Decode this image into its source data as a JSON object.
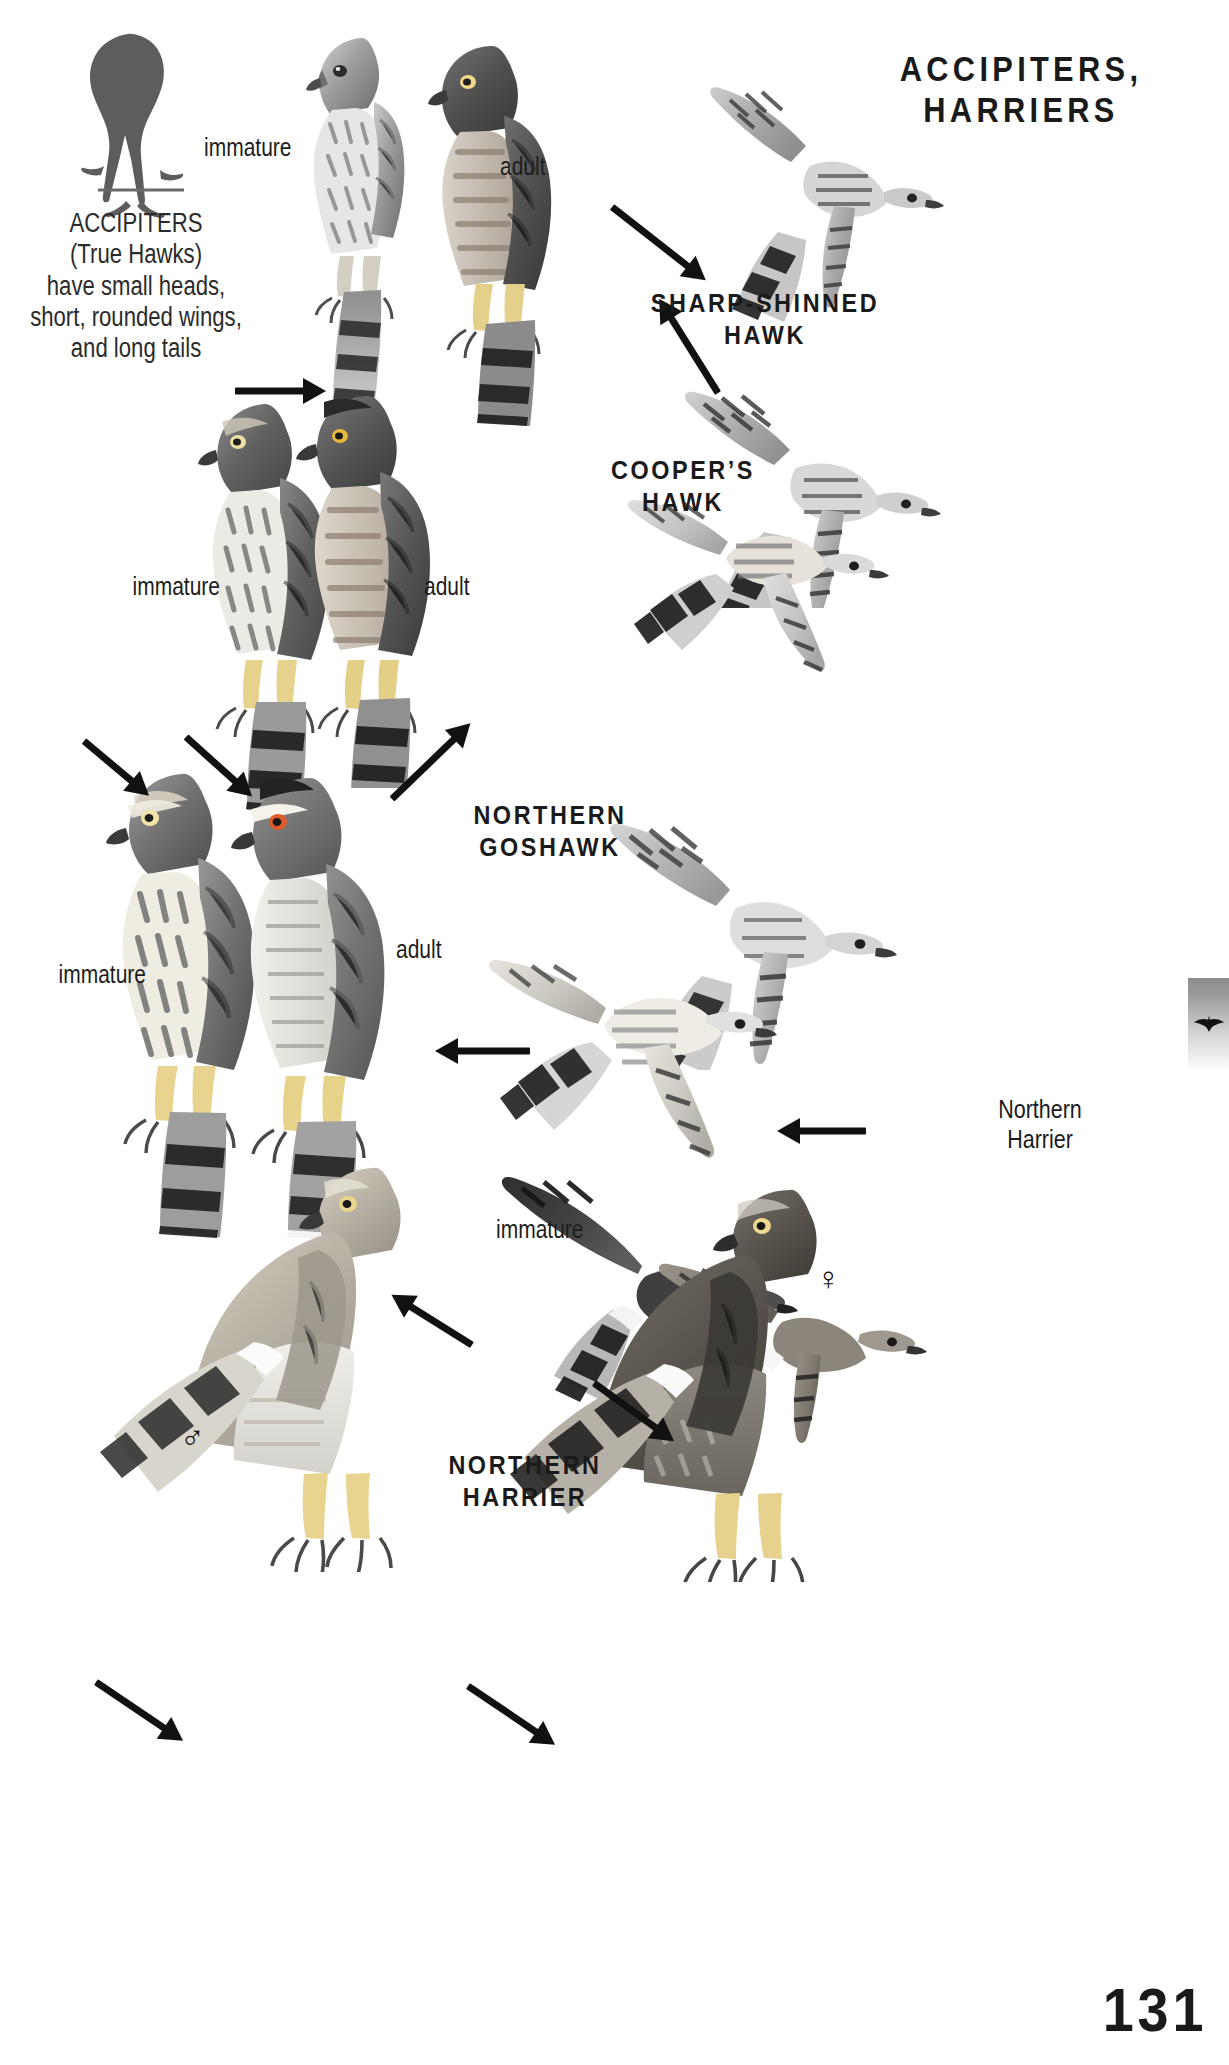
{
  "page": {
    "number": "131",
    "plate_title_line1": "ACCIPITERS,",
    "plate_title_line2": "HARRIERS"
  },
  "intro": {
    "line1": "ACCIPITERS",
    "line2": "(True Hawks)",
    "line3": "have small heads,",
    "line4": "short, rounded wings,",
    "line5": "and long tails"
  },
  "species": [
    {
      "id": "sharp-shinned-hawk",
      "line1": "SHARP-SHINNED",
      "line2": "HAWK"
    },
    {
      "id": "coopers-hawk",
      "line1": "COOPER’S",
      "line2": "HAWK"
    },
    {
      "id": "northern-goshawk",
      "line1": "NORTHERN",
      "line2": "GOSHAWK"
    },
    {
      "id": "northern-harrier",
      "line1": "NORTHERN",
      "line2": "HARRIER"
    }
  ],
  "age_labels": {
    "sharp_immature": "immature",
    "sharp_adult": "adult",
    "coopers_immature": "immature",
    "coopers_adult": "adult",
    "goshawk_immature": "immature",
    "goshawk_adult": "adult",
    "harrier_immature": "immature"
  },
  "side_labels": {
    "harrier_flight_line1": "Northern",
    "harrier_flight_line2": "Harrier"
  },
  "sex_symbols": {
    "male": "♂",
    "female": "♀"
  },
  "thumb_tab": {
    "icon": "flying-hawk-silhouette-icon",
    "glyph": "✈"
  },
  "icons": {
    "silhouette": "perched-accipiter-silhouette-icon",
    "arrow": "pointer-arrow-icon"
  },
  "colors": {
    "ink": "#1a1a1a",
    "paper": "#ffffff",
    "plate_gray_dark": "#4a4a4a",
    "plate_gray_mid": "#8f8f8f",
    "plate_gray_light": "#d8d8d8",
    "tab_gradient_start": "#8d8d8d",
    "tab_gradient_end": "#fdfdfd"
  }
}
